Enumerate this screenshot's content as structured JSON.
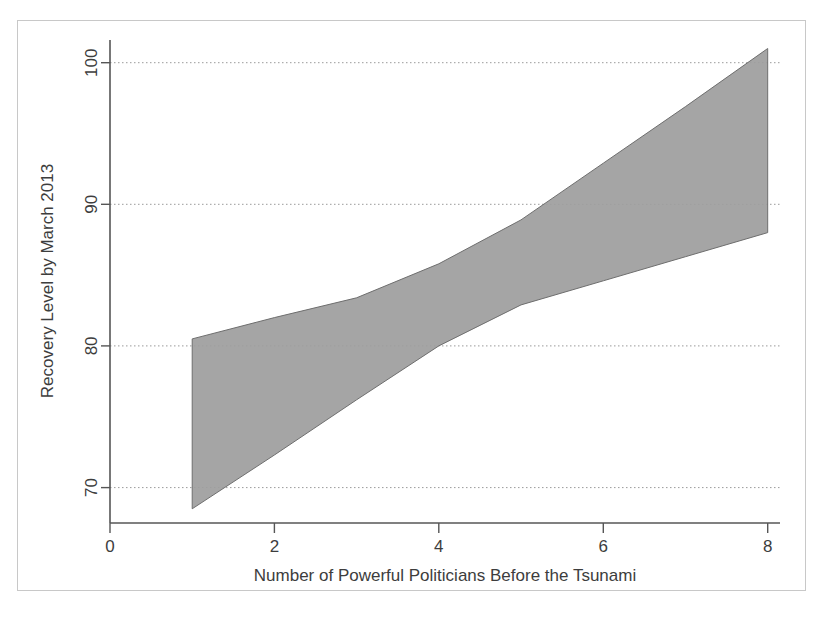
{
  "figure": {
    "background_color": "#ffffff",
    "frame_color": "#c8c8c8",
    "plot_area_color": "#ffffff"
  },
  "chart_data": {
    "type": "area",
    "title": "",
    "subtitle": "",
    "xlabel": "Number of Powerful Politicians Before the Tsunami",
    "ylabel": "Recovery Level by March 2013",
    "xlim": [
      0,
      8.15
    ],
    "ylim": [
      67.5,
      101.6
    ],
    "xticks": [
      0,
      2,
      4,
      6,
      8
    ],
    "xtick_labels": [
      "0",
      "2",
      "4",
      "6",
      "8"
    ],
    "yticks": [
      70,
      80,
      90,
      100
    ],
    "ytick_labels": [
      "70",
      "80",
      "90",
      "100"
    ],
    "grid": "horizontal-dotted",
    "legend": "none",
    "band_color": "#9d9d9d",
    "band_edge_color": "#6e6e6e",
    "x": [
      1,
      2,
      3,
      4,
      5,
      6,
      7,
      8
    ],
    "series": [
      {
        "name": "Upper confidence bound",
        "values": [
          80.5,
          82.0,
          83.4,
          85.8,
          88.9,
          92.9,
          96.9,
          101.0
        ]
      },
      {
        "name": "Lower confidence bound",
        "values": [
          68.5,
          72.3,
          76.2,
          80.0,
          82.9,
          84.6,
          86.3,
          88.0
        ]
      }
    ]
  },
  "axes": {
    "x_axis_label": "Number of Powerful Politicians Before the Tsunami",
    "y_axis_label": "Recovery Level by March 2013",
    "x_tick_0": "0",
    "x_tick_2": "2",
    "x_tick_4": "4",
    "x_tick_6": "6",
    "x_tick_8": "8",
    "y_tick_70": "70",
    "y_tick_80": "80",
    "y_tick_90": "90",
    "y_tick_100": "100"
  }
}
